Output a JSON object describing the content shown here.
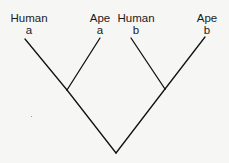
{
  "diagram": {
    "type": "phylogenetic-tree",
    "colors": {
      "background": "#f6f6f4",
      "line": "#111111",
      "text": "#1a1a1a"
    },
    "tips": [
      {
        "name": "Human",
        "sub": "a",
        "x": 29,
        "y": 12
      },
      {
        "name": "Ape",
        "sub": "a",
        "x": 100,
        "y": 12
      },
      {
        "name": "Human",
        "sub": "b",
        "x": 136,
        "y": 12
      },
      {
        "name": "Ape",
        "sub": "b",
        "x": 207,
        "y": 12
      }
    ],
    "nodes": {
      "left_junction": {
        "x": 67,
        "y": 90
      },
      "right_junction": {
        "x": 165,
        "y": 89
      },
      "root": {
        "x": 116,
        "y": 153
      }
    },
    "branches": [
      {
        "from": [
          25,
          39
        ],
        "to": [
          67,
          90
        ]
      },
      {
        "from": [
          100,
          38
        ],
        "to": [
          67,
          90
        ]
      },
      {
        "from": [
          67,
          90
        ],
        "to": [
          116,
          153
        ]
      },
      {
        "from": [
          131,
          38
        ],
        "to": [
          165,
          89
        ]
      },
      {
        "from": [
          205,
          37
        ],
        "to": [
          165,
          89
        ]
      },
      {
        "from": [
          165,
          89
        ],
        "to": [
          116,
          153
        ]
      }
    ]
  }
}
